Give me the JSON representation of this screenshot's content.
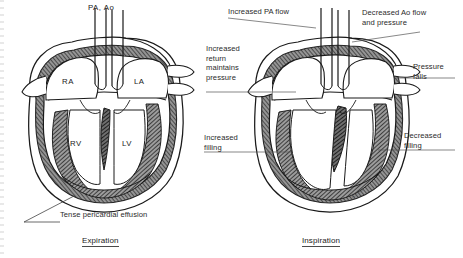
{
  "figure": {
    "signature": "Kesa"
  },
  "panels": [
    {
      "id": "expiration",
      "caption": "Expiration",
      "anatomy_labels": [
        {
          "key": "great-vessels",
          "text": "PA, Ao"
        },
        {
          "key": "right-atrium",
          "text": "RA"
        },
        {
          "key": "left-atrium",
          "text": "LA"
        },
        {
          "key": "right-ventricle",
          "text": "RV"
        },
        {
          "key": "left-ventricle",
          "text": "LV"
        }
      ],
      "annotations": [
        {
          "key": "pericardial-effusion",
          "text": "Tense pericardial effusion"
        }
      ]
    },
    {
      "id": "inspiration",
      "caption": "Inspiration",
      "annotations": [
        {
          "key": "pa-flow",
          "text": "Increased PA flow"
        },
        {
          "key": "ao-flow",
          "text": "Decreased Ao flow\nand pressure"
        },
        {
          "key": "venous-return",
          "text": "Increased\nreturn\nmaintains\npressure"
        },
        {
          "key": "pressure-falls",
          "text": "Pressure\nfalls"
        },
        {
          "key": "increased-filling",
          "text": "Increased\nfilling"
        },
        {
          "key": "decreased-filling",
          "text": "Decreased\nfilling"
        }
      ]
    }
  ],
  "colors": {
    "ink": "#1a1a1a",
    "myocardium": "#5a5a5a",
    "effusion": "#7a7a7a",
    "background": "#ffffff"
  }
}
